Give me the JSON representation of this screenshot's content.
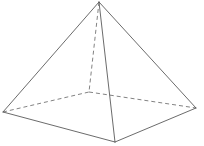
{
  "figure": {
    "shape_name": "square-pyramid",
    "projection": "oblique",
    "background_color": "#ffffff",
    "visible_edge_color": "#5a5a5a",
    "hidden_edge_color": "#6b6b6b",
    "visible_edge_width": 0.9,
    "hidden_edge_width": 0.85,
    "hidden_dash_pattern": "4 3",
    "canvas": {
      "width": 204,
      "height": 146
    }
  },
  "vertices": {
    "apex": {
      "label": "apex",
      "x": 99,
      "y": 2
    },
    "base_left": {
      "label": "base-left",
      "x": 3,
      "y": 112
    },
    "base_front": {
      "label": "base-front",
      "x": 115,
      "y": 142
    },
    "base_right": {
      "label": "base-right",
      "x": 196,
      "y": 108
    },
    "base_back": {
      "label": "base-back",
      "x": 89,
      "y": 92
    }
  },
  "edges": {
    "visible": [
      {
        "name": "apex-to-base-left",
        "from": "apex",
        "to": "base_left",
        "style": "solid"
      },
      {
        "name": "apex-to-base-front",
        "from": "apex",
        "to": "base_front",
        "style": "solid"
      },
      {
        "name": "apex-to-base-right",
        "from": "apex",
        "to": "base_right",
        "style": "solid"
      },
      {
        "name": "base-left-to-base-front",
        "from": "base_left",
        "to": "base_front",
        "style": "solid"
      },
      {
        "name": "base-front-to-base-right",
        "from": "base_front",
        "to": "base_right",
        "style": "solid"
      }
    ],
    "hidden": [
      {
        "name": "base-left-to-base-back",
        "from": "base_left",
        "to": "base_back",
        "style": "dashed"
      },
      {
        "name": "base-back-to-base-right",
        "from": "base_back",
        "to": "base_right",
        "style": "dashed"
      },
      {
        "name": "apex-to-base-back",
        "from": "apex",
        "to": "base_back",
        "style": "dashed"
      }
    ]
  }
}
